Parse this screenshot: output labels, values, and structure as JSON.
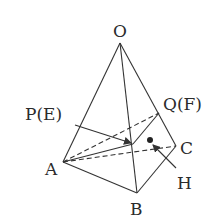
{
  "figure": {
    "type": "tetrahedron",
    "colors": {
      "line": "#333333",
      "background": "#ffffff"
    },
    "labels": {
      "O": "O",
      "A": "A",
      "B": "B",
      "C": "C",
      "P": "P(E)",
      "Q": "Q(F)",
      "H": "H"
    },
    "points": {
      "O": [
        120,
        43
      ],
      "A": [
        63,
        162
      ],
      "B": [
        137,
        193
      ],
      "C": [
        176,
        146
      ],
      "P": [
        133,
        144
      ],
      "Q": [
        159,
        113
      ],
      "H": [
        150,
        140
      ]
    },
    "solid_edges": [
      [
        "O",
        "A"
      ],
      [
        "O",
        "B"
      ],
      [
        "O",
        "C"
      ],
      [
        "A",
        "B"
      ],
      [
        "B",
        "C"
      ],
      [
        "A",
        "P"
      ],
      [
        "P",
        "Q"
      ]
    ],
    "dashed_edges": [
      [
        "A",
        "C"
      ],
      [
        "A",
        "Q"
      ]
    ],
    "arrows": [
      {
        "from_label": "P",
        "to": "P"
      },
      {
        "from_label": "H",
        "to": "H"
      }
    ]
  }
}
